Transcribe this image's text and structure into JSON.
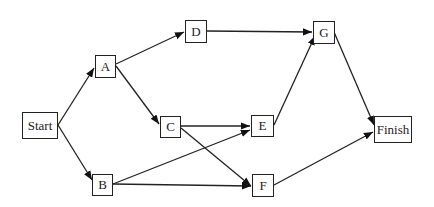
{
  "diagram": {
    "type": "network-activity-diagram",
    "nodes": [
      {
        "id": "start",
        "label": "Start",
        "x": 22,
        "y": 112,
        "w": 36,
        "h": 27
      },
      {
        "id": "a",
        "label": "A",
        "x": 95,
        "y": 55,
        "w": 21,
        "h": 23
      },
      {
        "id": "b",
        "label": "B",
        "x": 92,
        "y": 174,
        "w": 21,
        "h": 22
      },
      {
        "id": "c",
        "label": "C",
        "x": 160,
        "y": 116,
        "w": 21,
        "h": 22
      },
      {
        "id": "d",
        "label": "D",
        "x": 185,
        "y": 20,
        "w": 22,
        "h": 23
      },
      {
        "id": "e",
        "label": "E",
        "x": 251,
        "y": 115,
        "w": 23,
        "h": 22
      },
      {
        "id": "f",
        "label": "F",
        "x": 252,
        "y": 174,
        "w": 22,
        "h": 23
      },
      {
        "id": "g",
        "label": "G",
        "x": 313,
        "y": 21,
        "w": 22,
        "h": 23
      },
      {
        "id": "finish",
        "label": "Finish",
        "x": 374,
        "y": 116,
        "w": 38,
        "h": 27
      }
    ],
    "edges": [
      {
        "from": "Start",
        "to": "A",
        "x1": 58,
        "y1": 125,
        "x2": 94,
        "y2": 68
      },
      {
        "from": "Start",
        "to": "B",
        "x1": 58,
        "y1": 125,
        "x2": 92,
        "y2": 180
      },
      {
        "from": "A",
        "to": "D",
        "x1": 116,
        "y1": 64,
        "x2": 184,
        "y2": 32
      },
      {
        "from": "A",
        "to": "C",
        "x1": 116,
        "y1": 66,
        "x2": 159,
        "y2": 124
      },
      {
        "from": "C",
        "to": "E",
        "x1": 181,
        "y1": 126,
        "x2": 250,
        "y2": 126
      },
      {
        "from": "C",
        "to": "F",
        "x1": 181,
        "y1": 128,
        "x2": 251,
        "y2": 186
      },
      {
        "from": "B",
        "to": "E",
        "x1": 113,
        "y1": 184,
        "x2": 250,
        "y2": 130
      },
      {
        "from": "B",
        "to": "F",
        "x1": 113,
        "y1": 184,
        "x2": 251,
        "y2": 186
      },
      {
        "from": "D",
        "to": "G",
        "x1": 207,
        "y1": 31,
        "x2": 312,
        "y2": 32
      },
      {
        "from": "E",
        "to": "G",
        "x1": 274,
        "y1": 125,
        "x2": 315,
        "y2": 36
      },
      {
        "from": "G",
        "to": "Finish",
        "x1": 334,
        "y1": 32,
        "x2": 374,
        "y2": 125
      },
      {
        "from": "F",
        "to": "Finish",
        "x1": 274,
        "y1": 185,
        "x2": 373,
        "y2": 132
      }
    ]
  }
}
